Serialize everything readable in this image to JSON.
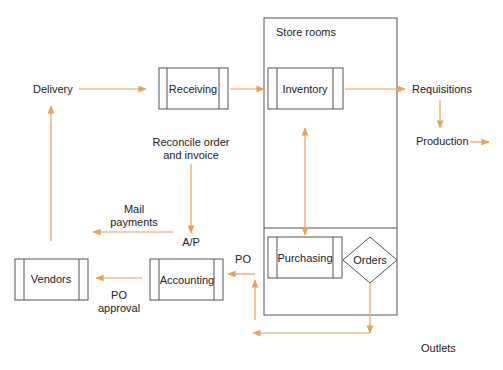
{
  "diagram": {
    "title": "",
    "colors": {
      "arrow": "#f0a050",
      "box_stroke": "#555555",
      "text": "#222222"
    },
    "container": {
      "label": "Store rooms"
    },
    "processes": {
      "receiving": "Receiving",
      "inventory": "Inventory",
      "purchasing": "Purchasing",
      "vendors": "Vendors",
      "accounting": "Accounting"
    },
    "decision": {
      "orders": "Orders"
    },
    "labels": {
      "delivery": "Delivery",
      "requisitions": "Requisitions",
      "production": "Production",
      "reconcile_line1": "Reconcile order",
      "reconcile_line2": "and invoice",
      "mail_line1": "Mail",
      "mail_line2": "payments",
      "ap": "A/P",
      "po": "PO",
      "po_approval_line1": "PO",
      "po_approval_line2": "approval",
      "outlets": "Outlets"
    },
    "edges": [
      {
        "from": "Delivery",
        "to": "Receiving"
      },
      {
        "from": "Receiving",
        "to": "Inventory"
      },
      {
        "from": "Inventory",
        "to": "Requisitions"
      },
      {
        "from": "Requisitions",
        "to": "Production"
      },
      {
        "from": "Production",
        "to": "(out)"
      },
      {
        "from": "Inventory",
        "to": "Purchasing",
        "bidirectional": true
      },
      {
        "from": "Reconcile order and invoice",
        "to": "A/P"
      },
      {
        "from": "A/P",
        "to": "Mail payments (left)"
      },
      {
        "from": "Vendors",
        "to": "Delivery"
      },
      {
        "from": "Accounting",
        "to": "Vendors",
        "label": "PO approval"
      },
      {
        "from": "PO",
        "to": "Accounting"
      },
      {
        "from": "Orders",
        "to": "PO (via bottom loop)"
      }
    ]
  }
}
